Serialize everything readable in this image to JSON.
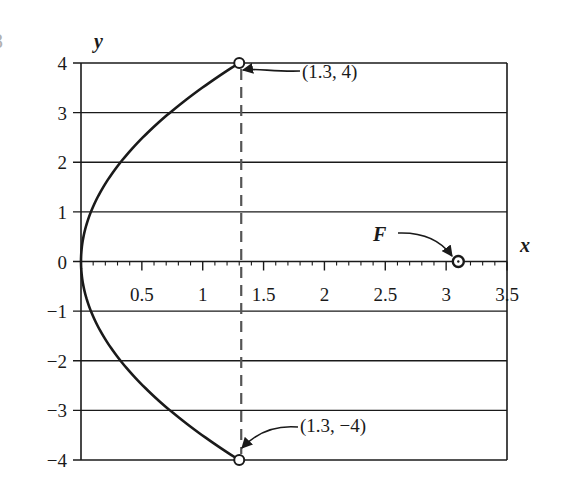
{
  "chart_data": {
    "type": "line",
    "title": "",
    "xlabel": "x",
    "ylabel": "y",
    "xlim": [
      0,
      3.5
    ],
    "ylim": [
      -4,
      4
    ],
    "grid": {
      "horizontal": true,
      "vertical": false
    },
    "x_ticks": [
      "0.5",
      "1",
      "1.5",
      "2",
      "2.5",
      "3",
      "3.5"
    ],
    "y_ticks": [
      "4",
      "3",
      "2",
      "1",
      "0",
      "−1",
      "−2",
      "−3",
      "−4"
    ],
    "series": [
      {
        "name": "parabola",
        "equation": "x = y^2 / 12.3",
        "x": [
          1.3,
          0.73,
          0.33,
          0.08,
          0,
          0.08,
          0.33,
          0.73,
          1.3
        ],
        "y": [
          4,
          3,
          2,
          1,
          0,
          -1,
          -2,
          -3,
          -4
        ]
      }
    ],
    "points": [
      {
        "label": "(1.3, 4)",
        "x": 1.3,
        "y": 4
      },
      {
        "label": "(1.3, −4)",
        "x": 1.3,
        "y": -4
      },
      {
        "label": "F",
        "x": 3.1,
        "y": 0
      }
    ],
    "annotations": [
      {
        "text": "(1.3, 4)",
        "target": [
          1.3,
          4
        ]
      },
      {
        "text": "(1.3, −4)",
        "target": [
          1.3,
          -4
        ]
      },
      {
        "text": "F",
        "target": [
          3.1,
          0
        ]
      }
    ],
    "dashed_line": {
      "x": 1.3,
      "from_y": -4,
      "to_y": 4
    }
  },
  "labels": {
    "x_axis": "x",
    "y_axis": "y",
    "focus": "F",
    "top_point": "(1.3, 4)",
    "bottom_point": "(1.3, −4)",
    "cutoff_glyph": "8"
  },
  "colors": {
    "ink": "#1a1a1a",
    "dashed": "#555555",
    "background": "#ffffff"
  }
}
